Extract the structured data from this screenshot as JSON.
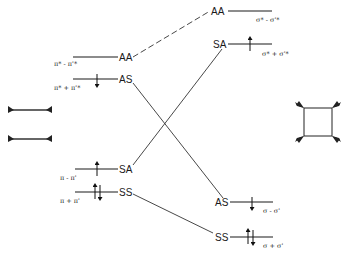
{
  "diagram": {
    "type": "orbital-correlation-diagram",
    "left": {
      "molecule": "two ethylenes (face-to-face)",
      "levels": [
        {
          "id": "AA",
          "symmetry": "AA",
          "orbital": "π* - π'*",
          "electrons": 0,
          "y": 57
        },
        {
          "id": "AS",
          "symmetry": "AS",
          "orbital": "π* + π'*",
          "electrons": 1,
          "spin": "down",
          "y": 79
        },
        {
          "id": "SA",
          "symmetry": "SA",
          "orbital": "π - π'",
          "electrons": 1,
          "spin": "up",
          "y": 169
        },
        {
          "id": "SS",
          "symmetry": "SS",
          "orbital": "π + π'",
          "electrons": 2,
          "y": 192
        }
      ]
    },
    "right": {
      "molecule": "cyclobutane",
      "levels": [
        {
          "id": "AA",
          "symmetry": "AA",
          "orbital": "σ* - σ'*",
          "electrons": 0,
          "y": 11
        },
        {
          "id": "SA",
          "symmetry": "SA",
          "orbital": "σ* + σ'*",
          "electrons": 1,
          "spin": "up",
          "y": 44
        },
        {
          "id": "AS",
          "symmetry": "AS",
          "orbital": "σ - σ'",
          "electrons": 1,
          "spin": "down",
          "y": 202
        },
        {
          "id": "SS",
          "symmetry": "SS",
          "orbital": "σ + σ'",
          "electrons": 2,
          "y": 237
        }
      ]
    },
    "correlations": [
      {
        "from": "left.AA",
        "to": "right.AA",
        "style": "dashed"
      },
      {
        "from": "left.AS",
        "to": "right.AS",
        "style": "solid"
      },
      {
        "from": "left.SA",
        "to": "right.SA",
        "style": "solid"
      },
      {
        "from": "left.SS",
        "to": "right.SS",
        "style": "solid"
      }
    ]
  },
  "labels": {
    "l_aa": "AA",
    "l_as": "AS",
    "l_sa": "SA",
    "l_ss": "SS",
    "r_aa": "AA",
    "r_sa": "SA",
    "r_as": "AS",
    "r_ss": "SS",
    "l_aa_orb": "π* - π'*",
    "l_as_orb": "π* + π'*",
    "l_sa_orb": "π - π'",
    "l_ss_orb": "π + π'",
    "r_aa_orb": "σ* - σ'*",
    "r_sa_orb": "σ* + σ'*",
    "r_as_orb": "σ - σ'",
    "r_ss_orb": "σ + σ'"
  }
}
